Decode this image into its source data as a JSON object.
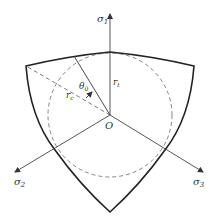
{
  "diagram": {
    "axes": [
      {
        "id": "sigma1",
        "symbol": "σ",
        "subscript": "1"
      },
      {
        "id": "sigma2",
        "symbol": "σ",
        "subscript": "2"
      },
      {
        "id": "sigma3",
        "symbol": "σ",
        "subscript": "3"
      }
    ],
    "origin_label": "O",
    "radius_t": {
      "symbol": "r",
      "subscript": "t"
    },
    "radius_c": {
      "symbol": "r",
      "subscript": "c"
    },
    "angle": {
      "symbol": "θ",
      "subscript": "0"
    },
    "colors": {
      "stroke": "#222222",
      "axis": "#444444",
      "dashed": "#666666",
      "background": "#ffffff"
    }
  }
}
